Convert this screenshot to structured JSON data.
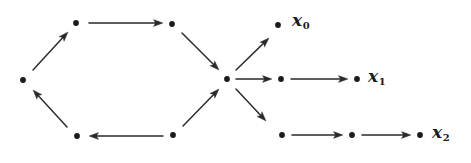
{
  "figure": {
    "kind": "directed-graph",
    "width": 471,
    "height": 163,
    "background_color": "#ffffff",
    "ink_color": "#2a2a2a",
    "dot_color": "#1b1b1b"
  },
  "labels": [
    {
      "id": "x0",
      "base": "x",
      "subscript": "0",
      "text": "x0",
      "x": 292,
      "y": 12
    },
    {
      "id": "x1",
      "base": "x",
      "subscript": "1",
      "text": "x1",
      "x": 368,
      "y": 68
    },
    {
      "id": "x2",
      "base": "x",
      "subscript": "2",
      "text": "x2",
      "x": 432,
      "y": 124
    }
  ],
  "nodes": [
    {
      "id": "n-left",
      "name": "left-vertex",
      "x": 23,
      "y": 80
    },
    {
      "id": "n-top-left",
      "name": "upper-left-vertex",
      "x": 76,
      "y": 23
    },
    {
      "id": "n-top-mid",
      "name": "upper-middle-vertex",
      "x": 172,
      "y": 24
    },
    {
      "id": "n-hub",
      "name": "central-hub-vertex",
      "x": 227,
      "y": 79
    },
    {
      "id": "n-bot-mid",
      "name": "lower-middle-vertex",
      "x": 173,
      "y": 135
    },
    {
      "id": "n-bot-left",
      "name": "lower-left-vertex",
      "x": 77,
      "y": 136
    },
    {
      "id": "n-x0",
      "name": "x0-terminal-vertex",
      "x": 278,
      "y": 25
    },
    {
      "id": "n-mid-a",
      "name": "middle-branch-vertex-1",
      "x": 281,
      "y": 79
    },
    {
      "id": "n-mid-b",
      "name": "middle-branch-vertex-2",
      "x": 357,
      "y": 79
    },
    {
      "id": "n-bot-a",
      "name": "lower-branch-vertex-1",
      "x": 282,
      "y": 135
    },
    {
      "id": "n-bot-b",
      "name": "lower-branch-vertex-2",
      "x": 352,
      "y": 135
    },
    {
      "id": "n-bot-c",
      "name": "lower-branch-vertex-3",
      "x": 420,
      "y": 135
    }
  ],
  "edges": [
    {
      "id": "e1",
      "name": "edge-left-to-upper-left",
      "from": "n-left",
      "to": "n-top-left",
      "x1": 33,
      "y1": 70,
      "x2": 68,
      "y2": 32
    },
    {
      "id": "e2",
      "name": "edge-upper-left-to-upper-mid",
      "from": "n-top-left",
      "to": "n-top-mid",
      "x1": 89,
      "y1": 23,
      "x2": 163,
      "y2": 23
    },
    {
      "id": "e3",
      "name": "edge-upper-mid-to-hub",
      "from": "n-top-mid",
      "to": "n-hub",
      "x1": 182,
      "y1": 33,
      "x2": 219,
      "y2": 70
    },
    {
      "id": "e4",
      "name": "edge-lower-mid-to-hub",
      "from": "n-bot-mid",
      "to": "n-hub",
      "x1": 183,
      "y1": 126,
      "x2": 219,
      "y2": 89
    },
    {
      "id": "e5",
      "name": "edge-lower-left-to-lower-mid",
      "from": "n-bot-mid",
      "to": "n-bot-left",
      "x1": 163,
      "y1": 136,
      "x2": 89,
      "y2": 136
    },
    {
      "id": "e6",
      "name": "edge-lower-left-to-left",
      "from": "n-bot-left",
      "to": "n-left",
      "x1": 67,
      "y1": 127,
      "x2": 33,
      "y2": 90
    },
    {
      "id": "e7",
      "name": "edge-hub-to-x0",
      "from": "n-hub",
      "to": "n-x0",
      "x1": 236,
      "y1": 70,
      "x2": 269,
      "y2": 38
    },
    {
      "id": "e8",
      "name": "edge-hub-to-middle-1",
      "from": "n-hub",
      "to": "n-mid-a",
      "x1": 236,
      "y1": 79,
      "x2": 272,
      "y2": 79
    },
    {
      "id": "e9",
      "name": "edge-hub-to-lower-1",
      "from": "n-hub",
      "to": "n-bot-a",
      "x1": 236,
      "y1": 89,
      "x2": 266,
      "y2": 121
    },
    {
      "id": "e10",
      "name": "edge-middle-1-to-middle-2",
      "from": "n-mid-a",
      "to": "n-mid-b",
      "x1": 291,
      "y1": 79,
      "x2": 348,
      "y2": 79
    },
    {
      "id": "e11",
      "name": "edge-lower-1-to-lower-2",
      "from": "n-bot-a",
      "to": "n-bot-b",
      "x1": 292,
      "y1": 135,
      "x2": 343,
      "y2": 135
    },
    {
      "id": "e12",
      "name": "edge-lower-2-to-lower-3",
      "from": "n-bot-b",
      "to": "n-bot-c",
      "x1": 362,
      "y1": 135,
      "x2": 411,
      "y2": 135
    }
  ]
}
